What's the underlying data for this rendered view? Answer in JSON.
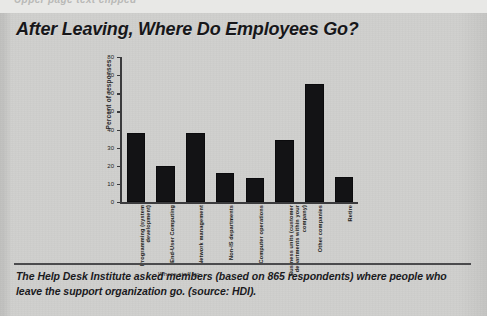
{
  "scan": {
    "cut_off_top_line": "Upper page text clipped"
  },
  "headline": "After Leaving, Where Do Employees Go?",
  "caption": "The Help Desk Institute asked members (based on 865 respondents) where people who leave the support organization go. (source: HDI).",
  "chart_data": {
    "type": "bar",
    "title": "After Leaving, Where Do Employees Go?",
    "xlabel": "Where staff go",
    "ylabel": "Percent of responses",
    "ylim": [
      0,
      80
    ],
    "yticks": [
      0,
      10,
      20,
      30,
      40,
      50,
      60,
      70,
      80
    ],
    "grid": false,
    "legend": false,
    "categories": [
      "Programming (system development)",
      "End-User Computing",
      "Network management",
      "Non-IS departments",
      "Computer operations",
      "Business units (customer departments within your company)",
      "Other companies",
      "Retire"
    ],
    "values": [
      38,
      20,
      38,
      16,
      13,
      34,
      65,
      14
    ],
    "bar_color": "#131315",
    "respondents": 865,
    "source": "HDI"
  }
}
